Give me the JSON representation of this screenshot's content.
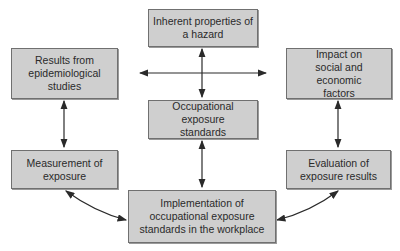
{
  "diagram": {
    "nodes": {
      "inherent": "Inherent properties of a hazard",
      "results": "Results from epidemiological studies",
      "impact": "Impact on social and economic factors",
      "occupational": "Occupational exposure standards",
      "measurement": "Measurement of exposure",
      "evaluation": "Evaluation of exposure results",
      "implementation": "Implementation of occupational exposure standards in the workplace"
    },
    "edges": [
      {
        "from": "inherent",
        "to": "occupational",
        "type": "bidirectional"
      },
      {
        "from": "center-cross",
        "to": "results",
        "type": "arrow"
      },
      {
        "from": "center-cross",
        "to": "impact",
        "type": "arrow"
      },
      {
        "from": "results",
        "to": "measurement",
        "type": "bidirectional"
      },
      {
        "from": "impact",
        "to": "evaluation",
        "type": "bidirectional"
      },
      {
        "from": "occupational",
        "to": "implementation",
        "type": "bidirectional"
      },
      {
        "from": "measurement",
        "to": "implementation",
        "type": "bidirectional-curved"
      },
      {
        "from": "evaluation",
        "to": "implementation",
        "type": "bidirectional-curved"
      }
    ]
  }
}
